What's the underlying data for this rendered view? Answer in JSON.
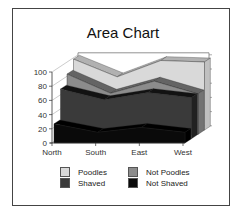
{
  "chart_data": {
    "type": "area",
    "subtype": "3d-area",
    "title": "Area Chart",
    "categories": [
      "North",
      "South",
      "East",
      "West"
    ],
    "series": [
      {
        "name": "Poodles",
        "values": [
          100,
          75,
          98,
          96
        ],
        "color": "#d9d9d9"
      },
      {
        "name": "Not Poodles",
        "values": [
          85,
          58,
          75,
          57
        ],
        "color": "#8c8c8c"
      },
      {
        "name": "Shaved",
        "values": [
          70,
          55,
          65,
          58
        ],
        "color": "#3a3a3a"
      },
      {
        "name": "Not Shaved",
        "values": [
          27,
          15,
          22,
          15
        ],
        "color": "#0a0a0a"
      }
    ],
    "yticks": [
      "0",
      "20",
      "40",
      "60",
      "80",
      "100"
    ],
    "ylim": [
      0,
      100
    ],
    "xlabel": "",
    "ylabel": "",
    "grid": false,
    "legend_position": "bottom"
  },
  "legend": [
    {
      "label": "Poodles",
      "color": "#d9d9d9"
    },
    {
      "label": "Not Poodles",
      "color": "#8c8c8c"
    },
    {
      "label": "Shaved",
      "color": "#3a3a3a"
    },
    {
      "label": "Not Shaved",
      "color": "#0a0a0a"
    }
  ]
}
